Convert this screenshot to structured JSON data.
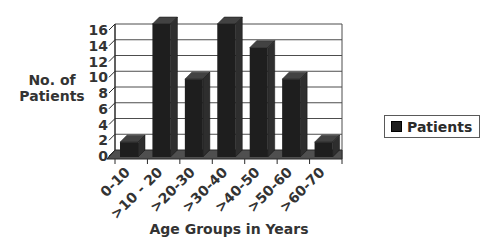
{
  "chart_data": {
    "type": "bar",
    "style": "3d-column",
    "title": "",
    "xlabel": "Age Groups in Years",
    "ylabel": "No. of Patients",
    "categories": [
      "0-10",
      ">10 - 20",
      ">20-30",
      ">30-40",
      ">40-50",
      ">50-60",
      ">60-70"
    ],
    "series": [
      {
        "name": "Patients",
        "values": [
          1,
          16,
          9,
          16,
          13,
          9,
          1
        ]
      }
    ],
    "ylim": [
      0,
      16
    ],
    "yticks": [
      0,
      2,
      4,
      6,
      8,
      10,
      12,
      14,
      16
    ],
    "grid": true,
    "legend_position": "right",
    "colors": {
      "bar_front": "#1e1e1e",
      "bar_top": "#424242",
      "bar_side": "#2e2e2e",
      "floor": "#4f4f4f",
      "gridline": "#4d4d4d",
      "axis": "#2b2b2b",
      "text": "#333333",
      "background": "#ffffff",
      "legend_border": "#595959"
    }
  },
  "legend": {
    "items": [
      {
        "label": "Patients",
        "swatch": "dark-square"
      }
    ]
  }
}
